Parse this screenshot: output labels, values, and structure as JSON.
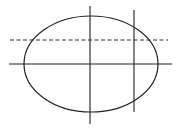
{
  "diagram": {
    "type": "ellipse-with-lines",
    "stroke_color": "#222222",
    "background": "#ffffff",
    "ellipse": {
      "cx": 91,
      "cy": 64,
      "rx": 67,
      "ry": 48
    },
    "lines": [
      {
        "name": "horizontal-axis",
        "x1": 9,
        "y1": 64,
        "x2": 172,
        "y2": 64,
        "dashed": false
      },
      {
        "name": "vertical-axis",
        "x1": 90,
        "y1": 6,
        "x2": 90,
        "y2": 124,
        "dashed": false
      },
      {
        "name": "dashed-horizontal-line",
        "x1": 10,
        "y1": 40,
        "x2": 168,
        "y2": 40,
        "dashed": true
      },
      {
        "name": "right-vertical-line",
        "x1": 134,
        "y1": 10,
        "x2": 134,
        "y2": 112,
        "dashed": false
      }
    ]
  }
}
